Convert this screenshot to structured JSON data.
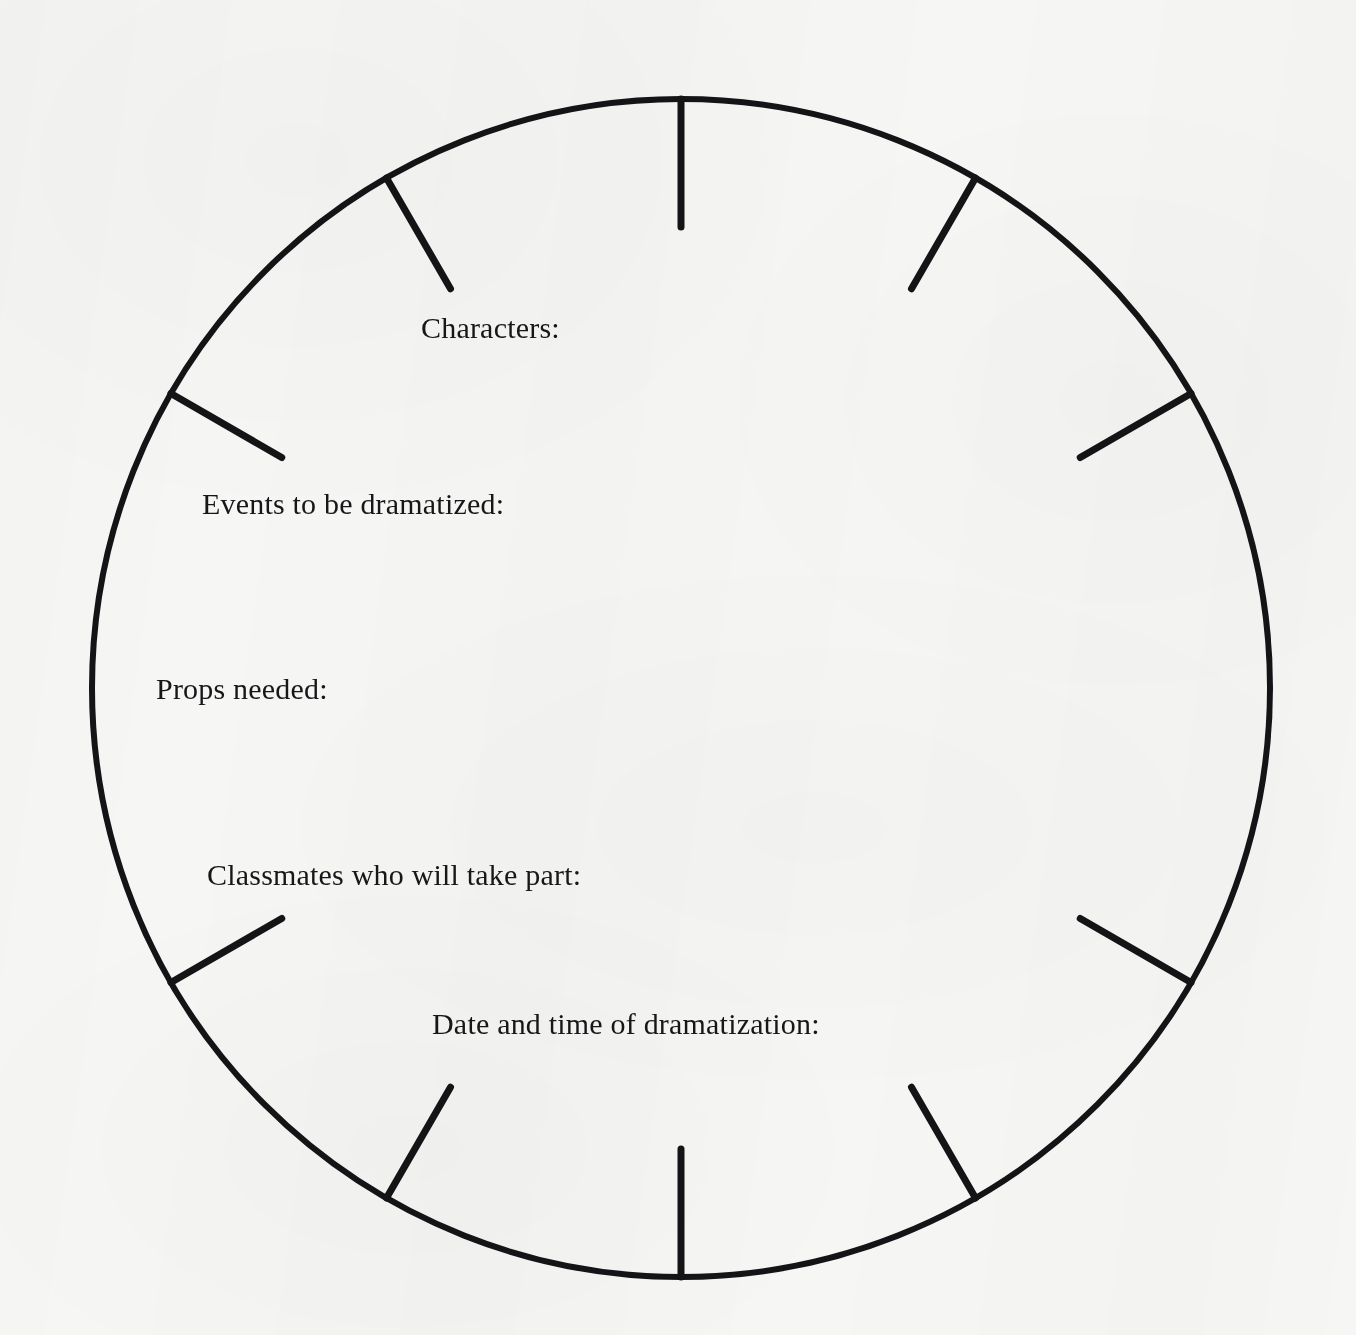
{
  "document": {
    "kind": "scanned-worksheet",
    "background_color": "#f6f6f4",
    "ink_color": "#141416"
  },
  "wheel": {
    "name": "planning-wheel",
    "center_x": 681,
    "center_y": 688,
    "radius": 589,
    "stroke_width": 6,
    "tick_inner_length": 128,
    "tick_stroke_width": 7,
    "tick_angles_deg": [
      0,
      30,
      60,
      120,
      150,
      180,
      210,
      240,
      300,
      330
    ],
    "tick_count": 10,
    "missing_tick_angles_deg": [
      90,
      270
    ]
  },
  "prompts": [
    {
      "id": "characters",
      "label": "Characters:",
      "x": 421,
      "y": 311
    },
    {
      "id": "events",
      "label": "Events to be dramatized:",
      "x": 202,
      "y": 487
    },
    {
      "id": "props",
      "label": "Props needed:",
      "x": 156,
      "y": 672
    },
    {
      "id": "classmates",
      "label": "Classmates who will take part:",
      "x": 207,
      "y": 858
    },
    {
      "id": "date-and-time",
      "label": "Date and time of dramatization:",
      "x": 432,
      "y": 1007
    }
  ]
}
